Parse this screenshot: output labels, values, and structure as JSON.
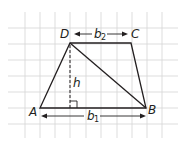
{
  "diagram": {
    "vertices": [
      {
        "label": "A",
        "x": 40,
        "y": 108
      },
      {
        "label": "B",
        "x": 146,
        "y": 108
      },
      {
        "label": "C",
        "x": 131,
        "y": 43
      },
      {
        "label": "D",
        "x": 70,
        "y": 43
      }
    ],
    "labels": {
      "A": "A",
      "B": "B",
      "C": "C",
      "D": "D",
      "h": "h",
      "b1_main": "b",
      "b1_sub": "1",
      "b2_main": "b",
      "b2_sub": "2"
    },
    "segments": [
      {
        "name": "base-b1",
        "from": "A",
        "to": "B"
      },
      {
        "name": "base-b2",
        "from": "D",
        "to": "C"
      },
      {
        "name": "leg-AD",
        "from": "A",
        "to": "D"
      },
      {
        "name": "leg-BC",
        "from": "B",
        "to": "C"
      },
      {
        "name": "diagonal-DB",
        "from": "D",
        "to": "B"
      }
    ],
    "height_line": {
      "label": "h",
      "style": "dashed",
      "right_angle_marker": true
    },
    "colors": {
      "stroke": "#231f20",
      "grid": "#d4d4d4",
      "background": "#ffffff"
    }
  }
}
